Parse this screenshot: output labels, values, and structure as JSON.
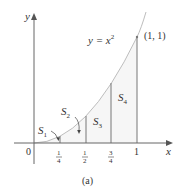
{
  "figure": {
    "caption": "(a)",
    "curve_label": "y = x",
    "curve_label_exp": "2",
    "point_label": "(1, 1)",
    "axes": {
      "x_label": "x",
      "y_label": "y",
      "origin_label": "0"
    },
    "ticks": [
      {
        "num": "1",
        "den": "4"
      },
      {
        "num": "1",
        "den": "2"
      },
      {
        "num": "3",
        "den": "4"
      }
    ],
    "tick_one": "1",
    "regions": [
      {
        "name": "S",
        "sub": "1"
      },
      {
        "name": "S",
        "sub": "2"
      },
      {
        "name": "S",
        "sub": "3"
      },
      {
        "name": "S",
        "sub": "4"
      }
    ],
    "colors": {
      "axis": "#555555",
      "curve": "#b8b8b8",
      "shade": "#f6f6f6",
      "line": "#777777"
    }
  }
}
